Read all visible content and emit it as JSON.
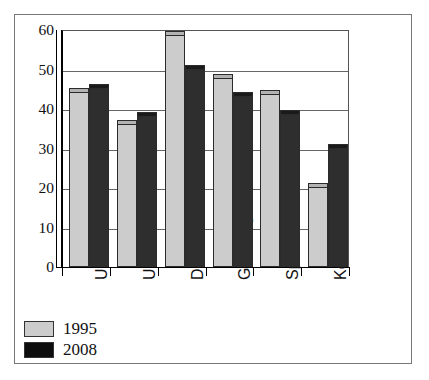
{
  "chart_data": {
    "type": "bar",
    "title": "",
    "xlabel": "",
    "ylabel": "",
    "ylim": [
      0,
      60
    ],
    "yticks": [
      0,
      10,
      20,
      30,
      40,
      50,
      60
    ],
    "ytick_labels": [
      "0",
      "10",
      "20",
      "30",
      "40",
      "50",
      "60"
    ],
    "grid": true,
    "legend_position": "bottom-left",
    "categories": [
      "UK",
      "US",
      "Denmark",
      "Germany",
      "Spain",
      "Korea"
    ],
    "series": [
      {
        "name": "1995",
        "color": "#cccccc",
        "values": [
          44,
          36,
          58.5,
          47.5,
          43.5,
          20
        ]
      },
      {
        "name": "2008",
        "color": "#0d0d0d",
        "values": [
          45,
          38,
          50,
          43,
          38.5,
          30
        ]
      }
    ]
  },
  "legend": {
    "items": [
      {
        "label": "1995",
        "swatch": "light-gray"
      },
      {
        "label": "2008",
        "swatch": "black"
      }
    ]
  }
}
